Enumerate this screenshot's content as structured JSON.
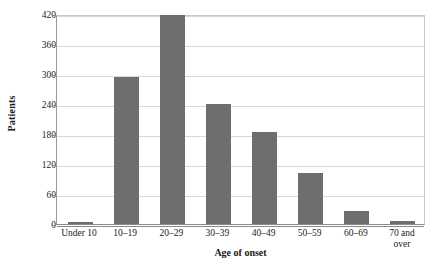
{
  "chart_data": {
    "type": "bar",
    "title": "",
    "xlabel": "Age of onset",
    "ylabel": "Patients",
    "categories": [
      "Under 10",
      "10–19",
      "20–29",
      "30–39",
      "40–49",
      "50–59",
      "60–69",
      "70 and\nover"
    ],
    "values": [
      5,
      295,
      418,
      241,
      184,
      102,
      27,
      7
    ],
    "ylim": [
      0,
      420
    ],
    "yticks": [
      0,
      60,
      120,
      180,
      240,
      300,
      360,
      420
    ],
    "ytick_labels": [
      "0",
      "60",
      "120",
      "180",
      "240",
      "300",
      "360",
      "420"
    ],
    "grid": true,
    "legend": false,
    "bar_color": "#6e6e6e",
    "gridline_color": "#d8d8d8",
    "axis_color": "#8a8a8a",
    "background_color": "#ffffff",
    "text_color": "#1a1a1a"
  }
}
